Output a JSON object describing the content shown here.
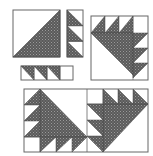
{
  "figure": {
    "colors": {
      "background": "#ffffff",
      "outline": "#555555",
      "fill": "#5a5a5a",
      "fill_dot": "#9a9a9a",
      "light": "#ffffff"
    },
    "units": [
      {
        "name": "large-half-square-triangle",
        "count": 1
      },
      {
        "name": "vertical-triangle-strip",
        "triangles": 3
      },
      {
        "name": "horizontal-triangle-strip",
        "triangles": 3,
        "plain_squares": 1
      },
      {
        "name": "assembled-block-top-right",
        "count": 1
      },
      {
        "name": "assembled-block-pair-bottom",
        "count": 2
      }
    ]
  }
}
